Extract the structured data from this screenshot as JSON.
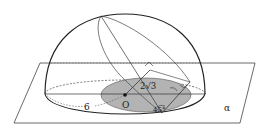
{
  "diagram": {
    "type": "geometry-3d",
    "labels": {
      "center": "O",
      "radius": "6",
      "distance": "2√3",
      "angle": "45°",
      "plane": "α"
    },
    "colors": {
      "stroke": "#222222",
      "shade": "#b3b3b3",
      "background": "#ffffff"
    }
  }
}
